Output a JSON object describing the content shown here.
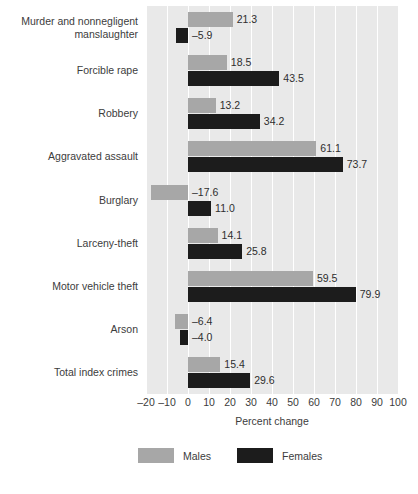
{
  "chart_data": {
    "type": "bar",
    "orientation": "horizontal",
    "title": "",
    "xlabel": "Percent change",
    "ylabel": "",
    "xlim": [
      -20,
      100
    ],
    "xticks": [
      -20,
      -10,
      0,
      10,
      20,
      30,
      40,
      50,
      60,
      70,
      80,
      90,
      100
    ],
    "xtick_labels": [
      "–20",
      "–10",
      "0",
      "10",
      "20",
      "30",
      "40",
      "50",
      "60",
      "70",
      "80",
      "90",
      "100"
    ],
    "grid": true,
    "grid_axis": "x",
    "legend_position": "bottom",
    "categories": [
      "Murder and nonnegligent\nmanslaughter",
      "Forcible rape",
      "Robbery",
      "Aggravated assault",
      "Burglary",
      "Larceny-theft",
      "Motor vehicle theft",
      "Arson",
      "Total index crimes"
    ],
    "series": [
      {
        "name": "Males",
        "color": "#a7a7a7",
        "values": [
          21.3,
          18.5,
          13.2,
          61.1,
          -17.6,
          14.1,
          59.5,
          -6.4,
          15.4
        ],
        "labels": [
          "21.3",
          "18.5",
          "13.2",
          "61.1",
          "–17.6",
          "14.1",
          "59.5",
          "–6.4",
          "15.4"
        ]
      },
      {
        "name": "Females",
        "color": "#1c1c1c",
        "values": [
          -5.9,
          43.5,
          34.2,
          73.7,
          11.0,
          25.8,
          79.9,
          -4.0,
          29.6
        ],
        "labels": [
          "–5.9",
          "43.5",
          "34.2",
          "73.7",
          "11.0",
          "25.8",
          "79.9",
          "–4.0",
          "29.6"
        ]
      }
    ]
  },
  "legend": {
    "items": [
      {
        "label": "Males",
        "color": "#a7a7a7"
      },
      {
        "label": "Females",
        "color": "#1c1c1c"
      }
    ]
  },
  "axis": {
    "x_title": "Percent change"
  },
  "colors": {
    "plot_background": "#e9e9e9",
    "gridline": "#ffffff",
    "males": "#a7a7a7",
    "females": "#1c1c1c",
    "text": "#3c3c3c",
    "page_background": "#ffffff"
  }
}
